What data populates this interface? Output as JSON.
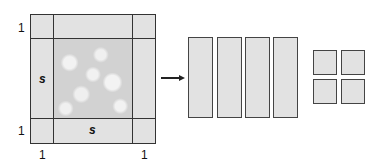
{
  "figure": {
    "left_square": {
      "labels": {
        "top_left_side": "1",
        "left_middle": "s",
        "bottom_left_side": "1",
        "bottom_middle": "s",
        "bottom_left_below": "1",
        "bottom_right_below": "1"
      },
      "colors": {
        "band": "#e2e2e2",
        "center": "#d2d2d2",
        "stroke": "#333333"
      }
    },
    "arrow": {
      "direction": "right"
    },
    "strips": {
      "count": 4,
      "color": "#e2e2e2"
    },
    "unit_squares": {
      "count": 4,
      "color": "#e2e2e2"
    }
  }
}
